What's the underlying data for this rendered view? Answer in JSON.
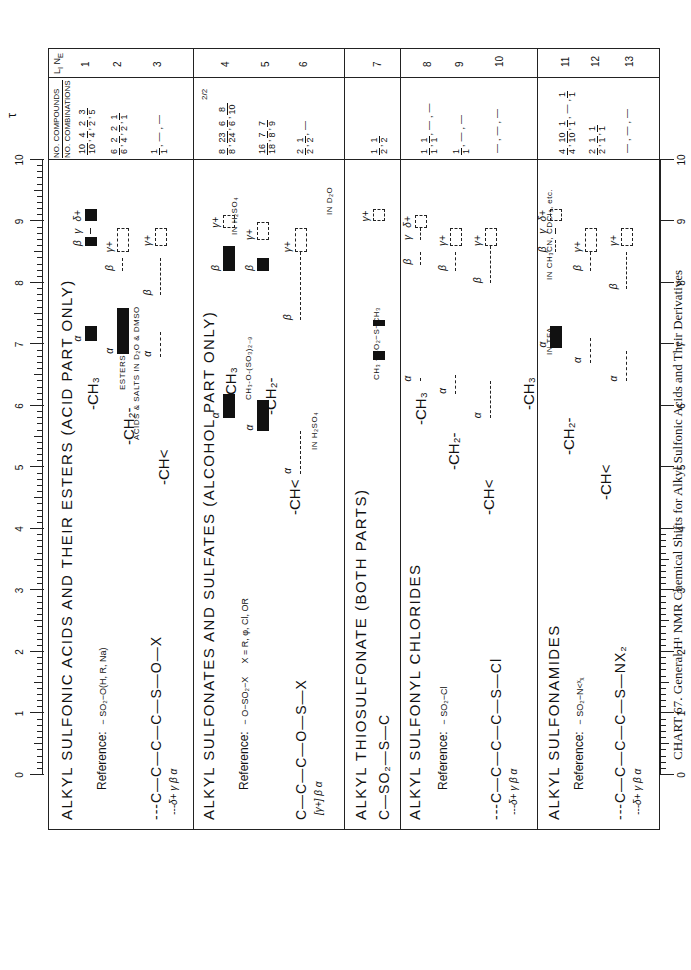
{
  "caption": "CHART 67. General H¹ NMR Chemical Shifts for Alkyl Sulfonic Acids and Their Derivatives",
  "header": {
    "tau_label": "τ",
    "compounds_header_top": "NO. COMPOUNDS",
    "compounds_header_bottom": "NO. COMBINATIONS",
    "ln_header": "L_I N_E"
  },
  "chart_data": {
    "type": "table",
    "title": "CHART 67. General H¹ NMR Chemical Shifts for Alkyl Sulfonic Acids and Their Derivatives",
    "xlabel": "τ",
    "x_axis": {
      "range": [
        10,
        0
      ],
      "ticks": [
        10,
        9,
        8,
        7,
        6,
        5,
        4,
        3,
        2,
        1,
        0
      ],
      "minor_ticks_per_unit": 10
    },
    "sections": [
      {
        "title": "ALKYL SULFONIC ACIDS AND THEIR ESTERS (ACID PART ONLY)",
        "reference": "Reference: −SO₂−O(H, R, Na)",
        "structure": "---C—C—C—C—S(=O)(=O)—O—X",
        "labels": [
          "δ+",
          "γ",
          "β",
          "α"
        ],
        "lines": [
          {
            "line": 1,
            "group": "-CH3",
            "compounds": "10/10, 4/4, 2/2, 3/5",
            "alpha": [
              7.05,
              7.3
            ],
            "beta": [
              8.6,
              8.75
            ],
            "gamma": [
              8.8,
              8.9
            ],
            "delta_plus": [
              9.0,
              9.2
            ]
          },
          {
            "line": 2,
            "group": "-CH2-",
            "compounds": "6/6, 2/4, 2/2, 1/1",
            "alpha_esters": [
              6.85,
              7.1
            ],
            "alpha_acids_salts": [
              7.1,
              7.6
            ],
            "note": "ACIDS & SALTS IN D2O & DMSO",
            "beta": [
              8.2,
              8.4
            ],
            "gamma_plus": [
              8.5,
              8.9
            ]
          },
          {
            "line": 3,
            "group": "-CH<",
            "compounds": "1/1, —, —",
            "alpha": [
              6.8,
              7.2
            ],
            "beta": [
              7.8,
              8.4
            ],
            "gamma_plus": [
              8.6,
              8.9
            ]
          }
        ]
      },
      {
        "title": "ALKYL SULFONATES AND SULFATES (ALCOHOL PART ONLY)",
        "reference": "Reference: −O−SO₂−X   X = R, φ, Cl, OR",
        "structure": "C—C—C—O—S(=O)(=O)—X",
        "labels": [
          "γ+",
          "β",
          "α"
        ],
        "lines": [
          {
            "line": 4,
            "group": "-CH3",
            "compounds": "8/8, 23/24, 6/6, 8/10, 2/2",
            "note": "CH3-O-(SO3)2-9; IN H2SO4",
            "alpha": [
              5.8,
              6.2
            ],
            "beta": [
              8.2,
              8.6
            ],
            "gamma_plus": [
              8.9,
              9.1
            ]
          },
          {
            "line": 5,
            "group": "-CH2-",
            "compounds": "16/18, 7/8, 7/9",
            "alpha": [
              5.6,
              6.1
            ],
            "beta": [
              8.2,
              8.4
            ],
            "gamma_plus": [
              8.7,
              9.0
            ]
          },
          {
            "line": 6,
            "group": "-CH<",
            "compounds": "2/2, 1/2, —",
            "note": "IN H2SO4; IN D2O",
            "alpha": [
              4.9,
              5.6
            ],
            "beta": [
              7.4,
              8.5
            ],
            "gamma_plus": [
              8.5,
              8.9
            ]
          }
        ]
      },
      {
        "title": "ALKYL THIOSULFONATE (BOTH PARTS)",
        "structure": "C—SO₂—S—C",
        "lines": [
          {
            "line": 7,
            "group": "CH3-SO2-S-CH3",
            "compounds": "1/2, 1/2",
            "ch3_so2": [
              6.75,
              6.9
            ],
            "s_ch3": [
              7.3,
              7.4
            ],
            "gamma_plus": [
              9.0,
              9.2
            ]
          }
        ]
      },
      {
        "title": "ALKYL SULFONYL CHLORIDES",
        "reference": "Reference: −SO₂−Cl",
        "structure": "---C—C—C—C—S(=O)(=O)—Cl",
        "labels": [
          "δ+",
          "γ",
          "β",
          "α"
        ],
        "lines": [
          {
            "line": 8,
            "group": "-CH3",
            "compounds": "1/1, 1/1, —, —",
            "alpha": [
              6.4,
              6.4
            ],
            "beta": [
              8.3,
              8.5
            ],
            "gamma": [
              8.7,
              8.9
            ],
            "delta_plus": [
              8.9,
              9.1
            ]
          },
          {
            "line": 9,
            "group": "-CH2-",
            "compounds": "1/1, —, —",
            "alpha": [
              6.2,
              6.5
            ],
            "beta": [
              8.2,
              8.5
            ],
            "gamma_plus": [
              8.6,
              8.9
            ]
          },
          {
            "line": 10,
            "group": "-CH<",
            "compounds": "—, —, —",
            "alpha": [
              5.8,
              6.4
            ],
            "beta": [
              8.0,
              8.6
            ],
            "gamma_plus": [
              8.6,
              8.9
            ]
          }
        ]
      },
      {
        "title": "ALKYL SULFONAMIDES",
        "reference": "Reference: −SO₂−N<X X",
        "structure": "---C—C—C—C—S(=O)(=O)—NX₂",
        "labels": [
          "δ+",
          "γ",
          "β",
          "α"
        ],
        "lines": [
          {
            "line": 11,
            "group": "-CH3",
            "compounds": "4/4, 10/10, 1/1, —, 1/1",
            "note": "IN TFA; IN CH3CN, CDCl3, etc.",
            "alpha": [
              6.95,
              7.3
            ],
            "beta": [
              8.5,
              8.7
            ],
            "gamma": [
              8.8,
              8.9
            ],
            "delta_plus": [
              9.0,
              9.2
            ]
          },
          {
            "line": 12,
            "group": "-CH2-",
            "compounds": "2/2, 1/1, 1/1",
            "alpha": [
              6.7,
              7.1
            ],
            "beta": [
              8.2,
              8.5
            ],
            "gamma_plus": [
              8.5,
              8.9
            ]
          },
          {
            "line": 13,
            "group": "-CH<",
            "compounds": "—, —, —",
            "alpha": [
              6.4,
              6.9
            ],
            "beta": [
              7.9,
              8.5
            ],
            "gamma_plus": [
              8.6,
              8.9
            ]
          }
        ]
      }
    ]
  },
  "axis": {
    "top_ticks": [
      "10",
      "9",
      "8",
      "7",
      "6",
      "5",
      "4",
      "3",
      "2",
      "1",
      "0"
    ],
    "bottom_ticks": [
      "10",
      "9",
      "8",
      "7",
      "6",
      "5",
      "4",
      "3",
      "2",
      "1",
      "0"
    ],
    "bottom_extra": "8"
  },
  "sections": [
    {
      "title": "ALKYL  SULFONIC  ACIDS  AND  THEIR  ESTERS  (ACID  PART  ONLY)",
      "ref_label": "Reference:",
      "ref_formula": "− SO₂−O(H, R, Na)",
      "structure": "---C—C—C—C—S—O—X",
      "struct_o_top": "O",
      "struct_o_bot": "O",
      "struct_labels": "---δ+     γ      β      α",
      "groups": [
        "-CH₃",
        "-CH₂-",
        "-CH<"
      ],
      "notes": {
        "esters": "ESTERS",
        "acids": "ACIDS & SALTS IN D₂O & DMSO"
      },
      "compounds": [
        [
          [
            "10",
            "10"
          ],
          [
            "4",
            "4"
          ],
          [
            "2",
            "2"
          ],
          [
            "3",
            "5"
          ]
        ],
        [
          [
            "6",
            "6"
          ],
          [
            "2",
            "4"
          ],
          [
            "2",
            "2"
          ],
          [
            "1",
            "1"
          ]
        ],
        [
          [
            "1",
            "1"
          ],
          [
            "—",
            ""
          ],
          [
            "—",
            ""
          ]
        ]
      ],
      "line_numbers": [
        "1",
        "2",
        "3"
      ]
    },
    {
      "title": "ALKYL  SULFONATES  AND  SULFATES  (ALCOHOL  PART  ONLY)",
      "ref_label": "Reference:",
      "ref_formula": "− O−SO₂−X",
      "ref_x": "X = R, φ, Cl, OR",
      "structure": "C—C—C—O—S—X",
      "struct_labels": "[γ+]     β     α",
      "groups": [
        "-CH₃",
        "-CH₂-",
        "-CH<"
      ],
      "notes": {
        "ch3o": "CH₃-O-(SO₃)₂₋₉",
        "h2so4_a": "IN H₂SO₄",
        "h2so4_b": "IN H₂SO₄",
        "d2o": "IN D₂O"
      },
      "compounds": [
        [
          [
            "8",
            "8"
          ],
          [
            "23",
            "24"
          ],
          [
            "6",
            "6"
          ],
          [
            "8",
            "10"
          ]
        ],
        [
          [
            "16",
            "18"
          ],
          [
            "7",
            "8"
          ],
          [
            "7",
            "9"
          ]
        ],
        [
          [
            "2",
            "2"
          ],
          [
            "1",
            "2"
          ],
          [
            "—",
            ""
          ]
        ]
      ],
      "extra_compound": "2/2",
      "line_numbers": [
        "4",
        "5",
        "6"
      ]
    },
    {
      "title": "ALKYL  THIOSULFONATE   (BOTH  PARTS)",
      "structure": "C—SO₂—S—C",
      "groups": [],
      "notes": {
        "thio": "CH₃ −SO₂−S−CH₃"
      },
      "compounds": [
        [
          [
            "1",
            "2"
          ],
          [
            "1",
            "2"
          ]
        ]
      ],
      "line_numbers": [
        "7"
      ]
    },
    {
      "title": "ALKYL  SULFONYL  CHLORIDES",
      "ref_label": "Reference:",
      "ref_formula": "− SO₂−Cl",
      "structure": "---C—C—C—C—S—Cl",
      "struct_labels": "---δ+     γ      β      α",
      "groups": [
        "-CH₃",
        "-CH₂-",
        "-CH<"
      ],
      "compounds": [
        [
          [
            "1",
            "1"
          ],
          [
            "1",
            "1"
          ],
          [
            "—",
            ""
          ],
          [
            "—",
            ""
          ]
        ],
        [
          [
            "1",
            "1"
          ],
          [
            "—",
            ""
          ],
          [
            "—",
            ""
          ]
        ],
        [
          [
            "—",
            ""
          ],
          [
            "—",
            ""
          ],
          [
            "—",
            ""
          ]
        ]
      ],
      "line_numbers": [
        "8",
        "9",
        "10"
      ]
    },
    {
      "title": "ALKYL  SULFONAMIDES",
      "ref_label": "Reference:",
      "ref_formula": "− SO₂−N<ˣₓ",
      "structure": "---C—C—C—C—S—NX₂",
      "struct_labels": "---δ+     γ      β      α",
      "groups": [
        "-CH₃",
        "-CH₂-",
        "-CH<"
      ],
      "notes": {
        "tfa": "IN TFA",
        "ch3cn": "IN CH₃CN, CDCl₃, etc."
      },
      "compounds": [
        [
          [
            "4",
            "4"
          ],
          [
            "10",
            "10"
          ],
          [
            "1",
            "1"
          ],
          [
            "—",
            ""
          ],
          [
            "1",
            "1"
          ]
        ],
        [
          [
            "2",
            "2"
          ],
          [
            "1",
            "1"
          ],
          [
            "1",
            "1"
          ]
        ],
        [
          [
            "—",
            ""
          ],
          [
            "—",
            ""
          ],
          [
            "—",
            ""
          ]
        ]
      ],
      "line_numbers": [
        "11",
        "12",
        "13"
      ]
    }
  ],
  "greek": {
    "alpha": "α",
    "beta": "β",
    "gamma": "γ",
    "gamma_plus": "γ+",
    "delta_plus": "δ+"
  }
}
